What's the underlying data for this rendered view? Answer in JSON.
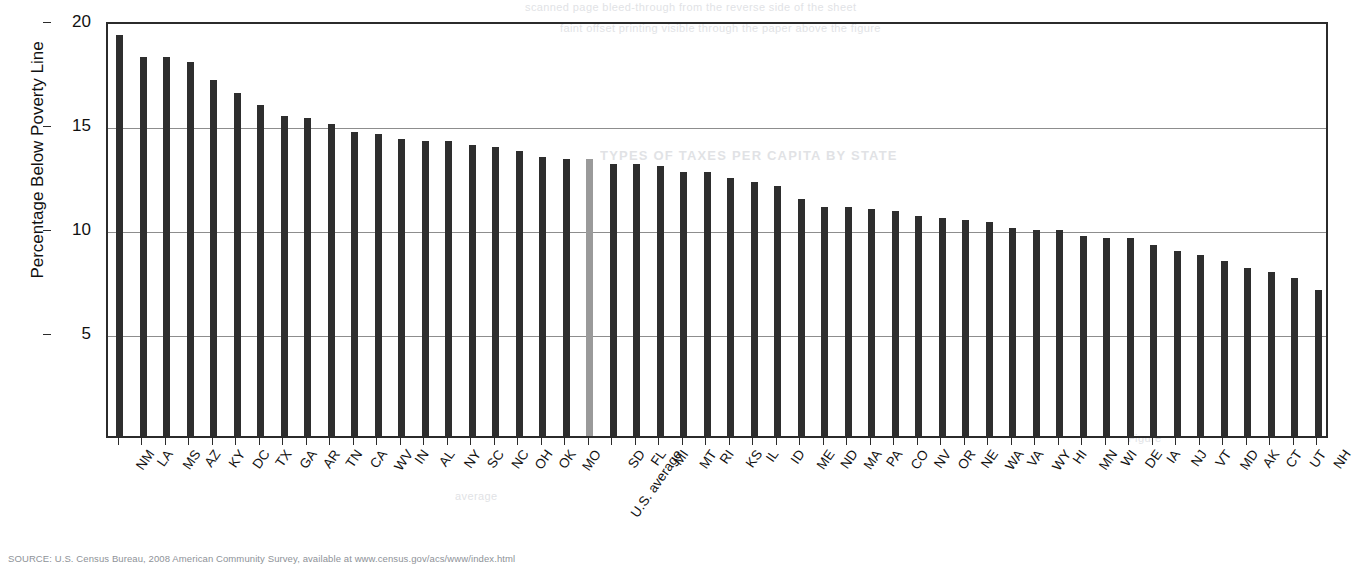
{
  "page": {
    "source_note": "SOURCE: U.S. Census Bureau, 2008 American Community Survey, available at www.census.gov/acs/www/index.html",
    "ghost_text": {
      "line1": "scanned page bleed-through from the reverse side of the sheet",
      "line2": "faint offset printing visible through the paper above the figure",
      "line3": "TYPES OF TAXES PER CAPITA BY STATE",
      "line4": "Figure",
      "line5": "average"
    },
    "colors": {
      "bar": "#2e2e2e",
      "us_average_bar": "#9a9a9a",
      "axis": "#2b2b2b",
      "gridline": "#8d8d8d",
      "background": "#ffffff"
    }
  },
  "chart_data": {
    "type": "bar",
    "title": "",
    "xlabel": "",
    "ylabel": "Percentage Below Poverty Line",
    "ylim": [
      0,
      20
    ],
    "yticks": [
      5,
      10,
      15,
      20
    ],
    "grid": true,
    "legend": "none",
    "highlight_category": "U.S. average",
    "categories": [
      "NM",
      "LA",
      "MS",
      "AZ",
      "KY",
      "DC",
      "TX",
      "GA",
      "AR",
      "TN",
      "CA",
      "WV",
      "IN",
      "AL",
      "NY",
      "SC",
      "NC",
      "OH",
      "OK",
      "MO",
      "U.S. average",
      "SD",
      "FL",
      "MI",
      "MT",
      "RI",
      "KS",
      "IL",
      "ID",
      "ME",
      "ND",
      "MA",
      "PA",
      "CO",
      "NV",
      "OR",
      "NE",
      "WA",
      "VA",
      "WY",
      "HI",
      "MN",
      "WI",
      "DE",
      "IA",
      "NJ",
      "VT",
      "MD",
      "AK",
      "CT",
      "UT",
      "NH"
    ],
    "values": [
      19.3,
      18.2,
      18.2,
      18.0,
      17.1,
      16.5,
      15.9,
      15.4,
      15.3,
      15.0,
      14.6,
      14.5,
      14.3,
      14.2,
      14.2,
      14.0,
      13.9,
      13.7,
      13.4,
      13.3,
      13.3,
      13.1,
      13.1,
      13.0,
      12.7,
      12.7,
      12.4,
      12.2,
      12.0,
      11.4,
      11.0,
      11.0,
      10.9,
      10.8,
      10.6,
      10.5,
      10.4,
      10.3,
      10.0,
      9.9,
      9.9,
      9.6,
      9.5,
      9.5,
      9.2,
      8.9,
      8.7,
      8.4,
      8.1,
      7.9,
      7.6,
      7.0
    ],
    "units": "percent"
  }
}
